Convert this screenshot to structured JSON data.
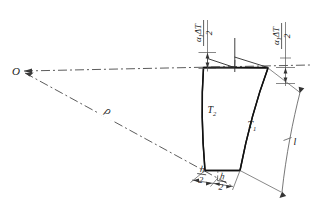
{
  "figure": {
    "kind": "engineering-diagram",
    "background_color": "#ffffff",
    "line_color": "#1a1a1a",
    "thin_line_color": "#555555"
  },
  "labels": {
    "center_point": "O",
    "radius": "ρ",
    "temperature_outer": "T",
    "temperature_outer_sub": "1",
    "temperature_inner": "T",
    "temperature_inner_sub": "2",
    "length": "l",
    "expansion_num_alpha": "α",
    "expansion_num_alpha_sub": "1",
    "expansion_num_rest": "ΔT",
    "expansion_den": "2",
    "thickness_num": "h",
    "thickness_den": "2"
  },
  "annotations": {
    "expansion_left": {
      "numerator": "α₁ΔT",
      "denominator": "2",
      "rotation_deg": -90
    },
    "expansion_right": {
      "numerator": "α₁ΔT",
      "denominator": "2",
      "rotation_deg": -90
    },
    "thickness_left": {
      "numerator": "h",
      "denominator": "2"
    },
    "thickness_right": {
      "numerator": "h",
      "denominator": "2"
    }
  },
  "geometry": {
    "origin_x": 22,
    "origin_y": 72,
    "beam_top_left_x": 203,
    "beam_top_y": 67,
    "beam_top_right_x": 268,
    "beam_bottom_left_x": 205,
    "beam_bottom_y": 171,
    "beam_bottom_right_x": 240
  }
}
